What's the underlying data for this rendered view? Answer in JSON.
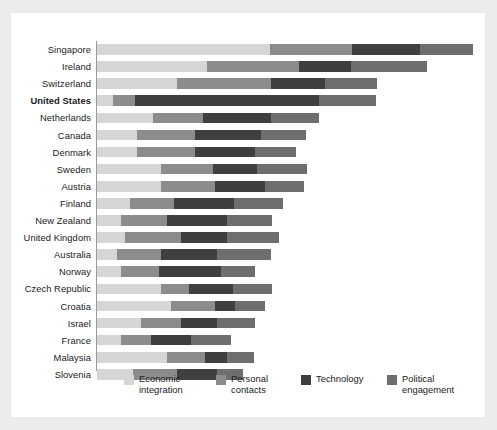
{
  "chart_data": {
    "type": "bar",
    "subtype": "stacked-horizontal",
    "title": "",
    "subtitle": "",
    "xlabel": "",
    "ylabel": "",
    "grid": false,
    "legend_position": "bottom",
    "xlim": [
      0,
      100
    ],
    "highlight_category": "United States",
    "categories": [
      "Singapore",
      "Ireland",
      "Switzerland",
      "United States",
      "Netherlands",
      "Canada",
      "Denmark",
      "Sweden",
      "Austria",
      "Finland",
      "New Zealand",
      "United Kingdom",
      "Australia",
      "Norway",
      "Czech Republic",
      "Croatia",
      "Israel",
      "France",
      "Malaysia",
      "Slovenia"
    ],
    "series": [
      {
        "name": "Economic integration",
        "color": "#d6d6d6",
        "values": [
          44.6,
          28.4,
          20.6,
          4.1,
          14.4,
          10.3,
          10.3,
          16.5,
          16.5,
          8.5,
          6.2,
          7.2,
          5.2,
          6.2,
          16.5,
          19.1,
          11.3,
          6.2,
          18.0,
          9.3
        ]
      },
      {
        "name": "Personal contacts",
        "color": "#8c8c8c",
        "values": [
          21.1,
          23.7,
          24.2,
          5.7,
          12.9,
          14.9,
          14.9,
          13.4,
          13.9,
          11.3,
          11.9,
          14.4,
          11.3,
          9.8,
          7.2,
          11.3,
          10.3,
          7.7,
          9.8,
          11.3
        ]
      },
      {
        "name": "Technology",
        "color": "#3f3f3f",
        "values": [
          17.5,
          13.4,
          13.9,
          47.4,
          17.5,
          17.0,
          15.5,
          11.3,
          12.9,
          15.5,
          15.5,
          11.9,
          14.4,
          16.0,
          11.3,
          5.2,
          9.3,
          10.3,
          5.7,
          10.3
        ]
      },
      {
        "name": "Political engagement",
        "color": "#6e6e6e",
        "values": [
          13.7,
          19.6,
          13.4,
          14.7,
          12.4,
          11.6,
          10.6,
          12.9,
          10.0,
          12.6,
          11.6,
          13.4,
          13.9,
          8.8,
          10.0,
          7.7,
          9.8,
          10.3,
          7.0,
          6.7
        ]
      }
    ],
    "legend": [
      {
        "label": "Economic\nintegration",
        "color": "#d6d6d6"
      },
      {
        "label": "Personal\ncontacts",
        "color": "#8c8c8c"
      },
      {
        "label": "Technology",
        "color": "#3f3f3f"
      },
      {
        "label": "Political\nengagement",
        "color": "#6e6e6e"
      }
    ]
  },
  "colors": {
    "page_background": "#ececec",
    "card_background": "#ffffff",
    "axis": "#9a9a9a",
    "text": "#1b1b1b"
  }
}
